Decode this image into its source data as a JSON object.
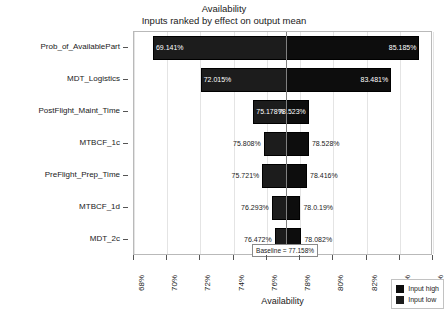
{
  "chart_data": {
    "type": "bar",
    "title": "Availability",
    "subtitle": "Inputs ranked by effect on output mean",
    "xlabel": "Availability",
    "ylabel": "",
    "xlim": [
      68,
      86
    ],
    "xticks": [
      "68%",
      "70%",
      "72%",
      "74%",
      "76%",
      "78%",
      "80%",
      "82%",
      "84%",
      "86%"
    ],
    "xtick_values": [
      68,
      70,
      72,
      74,
      76,
      78,
      80,
      82,
      84,
      86
    ],
    "grid": true,
    "legend_position": "bottom-right",
    "baseline": {
      "value": 77.158,
      "label": "Baseline = 77.158%"
    },
    "categories": [
      "Prob_of_AvailablePart",
      "MDT_Logistics",
      "PostFlight_Maint_Time",
      "MTBCF_1c",
      "PreFlight_Prep_Time",
      "MTBCF_1d",
      "MDT_2c"
    ],
    "series": [
      {
        "name": "Input low",
        "values": [
          69.141,
          72.015,
          75.178,
          75.808,
          75.721,
          76.293,
          76.472
        ]
      },
      {
        "name": "Input high",
        "values": [
          85.185,
          83.481,
          78.523,
          78.528,
          78.416,
          78.019,
          78.082
        ]
      }
    ],
    "bars": [
      {
        "category": "Prob_of_AvailablePart",
        "low": 69.141,
        "high": 85.185,
        "low_label": "69.141%",
        "high_label": "85.185%",
        "labels_inside": true
      },
      {
        "category": "MDT_Logistics",
        "low": 72.015,
        "high": 83.481,
        "low_label": "72.015%",
        "high_label": "83.481%",
        "labels_inside": true
      },
      {
        "category": "PostFlight_Maint_Time",
        "low": 75.178,
        "high": 78.523,
        "low_label": "75.178%",
        "high_label": "78.523%",
        "labels_inside": true
      },
      {
        "category": "MTBCF_1c",
        "low": 75.808,
        "high": 78.528,
        "low_label": "75.808%",
        "high_label": "78.528%",
        "labels_inside": false
      },
      {
        "category": "PreFlight_Prep_Time",
        "low": 75.721,
        "high": 78.416,
        "low_label": "75.721%",
        "high_label": "78.416%",
        "labels_inside": false
      },
      {
        "category": "MTBCF_1d",
        "low": 76.293,
        "high": 78.019,
        "low_label": "76.293%",
        "high_label": "78.0.19%",
        "labels_inside": false
      },
      {
        "category": "MDT_2c",
        "low": 76.472,
        "high": 78.082,
        "low_label": "76.472%",
        "high_label": "78.082%",
        "labels_inside": false
      }
    ],
    "legend": [
      {
        "label": "Input high",
        "color": "#0d0d0d"
      },
      {
        "label": "Input low",
        "color": "#1c1c1c"
      }
    ],
    "colors": {
      "input_high": "#0d0d0d",
      "input_low": "#1c1c1c",
      "grid": "#e4e4e4",
      "frame": "#b9b9b9",
      "baseline": "#808080",
      "text": "#1a1a1a",
      "background": "#ffffff"
    }
  }
}
